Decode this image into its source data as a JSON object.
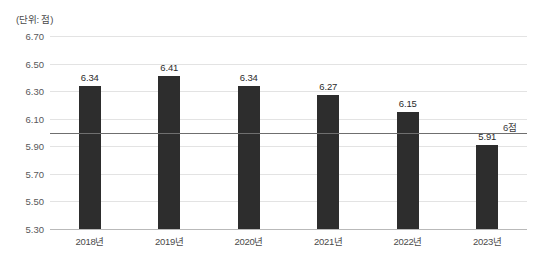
{
  "chart_data": {
    "type": "bar",
    "title": "",
    "subtitle": "",
    "unit_caption": "(단위: 점)",
    "xlabel": "",
    "ylabel": "",
    "categories": [
      "2018년",
      "2019년",
      "2020년",
      "2021년",
      "2022년",
      "2023년"
    ],
    "values": [
      6.34,
      6.41,
      6.34,
      6.27,
      6.15,
      5.91
    ],
    "value_labels": [
      "6.34",
      "6.41",
      "6.34",
      "6.27",
      "6.15",
      "5.91"
    ],
    "ylim": [
      5.3,
      6.7
    ],
    "ytick_values": [
      6.7,
      6.5,
      6.3,
      6.1,
      5.9,
      5.7,
      5.5,
      5.3
    ],
    "ytick_labels": [
      "6.70",
      "6.50",
      "6.30",
      "6.10",
      "5.90",
      "5.70",
      "5.50",
      "5.30"
    ],
    "grid": true,
    "legend": "none",
    "reference_line": {
      "value": 6.0,
      "label": "6점"
    },
    "colors": {
      "bar": "#2d2d2d",
      "gridline": "#e3e3e3",
      "axis": "#b9b9b9",
      "reference_line": "#6f6f6f",
      "text": "#3c3c3c",
      "background": "#ffffff"
    }
  }
}
